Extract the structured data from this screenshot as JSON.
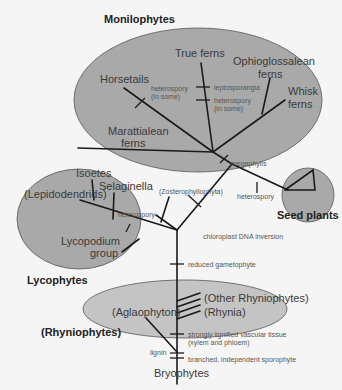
{
  "groups": {
    "monilophytes": "Monilophytes",
    "lycophytes": "Lycophytes",
    "rhyniophytes": "(Rhyniophytes)",
    "seed_plants": "Seed plants"
  },
  "taxa": {
    "true_ferns": "True ferns",
    "ophio_1": "Ophioglossalean",
    "ophio_2": "ferns",
    "horsetails": "Horsetails",
    "whisk_1": "Whisk",
    "whisk_2": "ferns",
    "maratt_1": "Marattialean",
    "maratt_2": "ferns",
    "isoetes": "Isoetes",
    "selaginella": "Selaginella",
    "lepido": "(Lepidodendrids)",
    "lyco_1": "Lycopodium",
    "lyco_2": "group",
    "zostero": "(Zosterophyllophyta)",
    "other_rhynio": "(Other Rhyniophytes)",
    "rhynia": "(Rhynia)",
    "aglaophyton": "(Aglaophyton)",
    "bryophytes": "Bryophytes"
  },
  "characters": {
    "hetero_horse_1": "heterospory",
    "hetero_horse_2": "(in some)",
    "leptosporangia": "leptosporangia",
    "hetero_fern_1": "heterospory",
    "hetero_fern_2": "(in some)",
    "megaphylls": "megaphylls",
    "hetero_seed": "heterospory",
    "hetero_lyco": "heterospory",
    "chloroplast": "chloroplast DNA inversion",
    "reduced_gam": "reduced gametophyte",
    "lignified_1": "strongly lignified vascular tissue",
    "lignified_2": "(xylem and phloem)",
    "lignin": "lignin",
    "sporophyte": "branched, independent sporophyte"
  },
  "colors": {
    "ellipse_fill": "#a9a9a9",
    "rhynio_fill": "#c4c4c4",
    "background": "#f5f5f5",
    "branch": "#1a1a1a"
  }
}
